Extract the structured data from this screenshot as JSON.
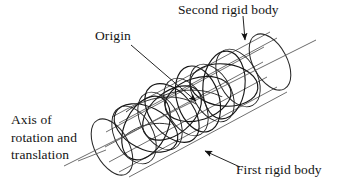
{
  "figure": {
    "type": "technical-line-diagram",
    "width": 348,
    "height": 187,
    "background_color": "#ffffff",
    "line_color": "#1a1a1a",
    "line_color_light": "#6b6b6b"
  },
  "labels": {
    "second_rigid_body": "Second rigid body",
    "origin": "Origin",
    "first_rigid_body": "First rigid body",
    "axis_line_1": "Axis of",
    "axis_line_2": "rotation and",
    "axis_line_3": "translation"
  },
  "annotations": [
    {
      "name": "second-rigid-body",
      "text": "Second rigid body",
      "leader_from": [
        243,
        16
      ],
      "leader_to": [
        245,
        43
      ],
      "arrowhead": true
    },
    {
      "name": "origin",
      "text": "Origin",
      "leader_from": [
        131,
        45
      ],
      "leader_to": [
        198,
        103
      ],
      "arrowhead": true
    },
    {
      "name": "first-rigid-body",
      "text": "First rigid body",
      "leader_from": [
        240,
        168
      ],
      "leader_to": [
        202,
        149
      ],
      "arrowhead": true
    },
    {
      "name": "axis-of-rotation-and-translation",
      "text": "Axis of rotation and translation",
      "leader_from": [
        78,
        160
      ],
      "leader_to": [
        104,
        150
      ],
      "arrowhead": false
    }
  ],
  "geometry": {
    "axis": {
      "x1": 64,
      "y1": 166,
      "x2": 316,
      "y2": 40
    },
    "cylinder_left_cap": {
      "cx": 112,
      "cy": 147,
      "rx": 17,
      "ry": 30,
      "rotation": -27
    },
    "cylinder_right_cap": {
      "cx": 270,
      "cy": 62,
      "rx": 17,
      "ry": 30,
      "rotation": -27
    },
    "lobe_count": 8,
    "generator_line_count": 6
  }
}
